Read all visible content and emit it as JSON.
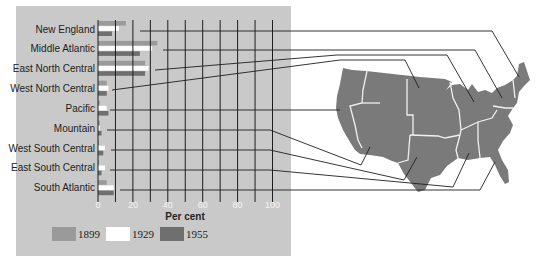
{
  "chart_data": {
    "type": "bar",
    "orientation": "horizontal",
    "title": "",
    "xlabel": "Per cent",
    "ylabel": "",
    "xlim": [
      0,
      100
    ],
    "x_ticks": [
      "0",
      "20",
      "40",
      "60",
      "80",
      "100"
    ],
    "grid": true,
    "legend_position": "bottom",
    "categories": [
      "New England",
      "Middle Atlantic",
      "East North Central",
      "West North Central",
      "Pacific",
      "Mountain",
      "West South Central",
      "East South Central",
      "South Atlantic"
    ],
    "series": [
      {
        "name": "1899",
        "color": "#9a9a9a",
        "values": [
          16,
          34,
          27,
          5,
          1,
          1,
          0.5,
          0.5,
          5
        ]
      },
      {
        "name": "1929",
        "color": "#ffffff",
        "values": [
          12,
          31,
          29,
          6,
          5,
          1,
          4,
          4,
          9
        ]
      },
      {
        "name": "1955",
        "color": "#6f6f6f",
        "values": [
          8,
          24,
          27,
          5,
          6,
          2,
          3,
          2,
          9
        ]
      }
    ],
    "annotations": [
      "Connector lines link each region label to its location on a map of the United States"
    ]
  },
  "colors": {
    "panel_bg": "#c9c9c9",
    "map_fill": "#7a7a7a",
    "gridline": "#1e1e1e"
  },
  "legend": [
    {
      "label": "1899",
      "color": "#9a9a9a"
    },
    {
      "label": "1929",
      "color": "#ffffff"
    },
    {
      "label": "1955",
      "color": "#6f6f6f"
    }
  ]
}
